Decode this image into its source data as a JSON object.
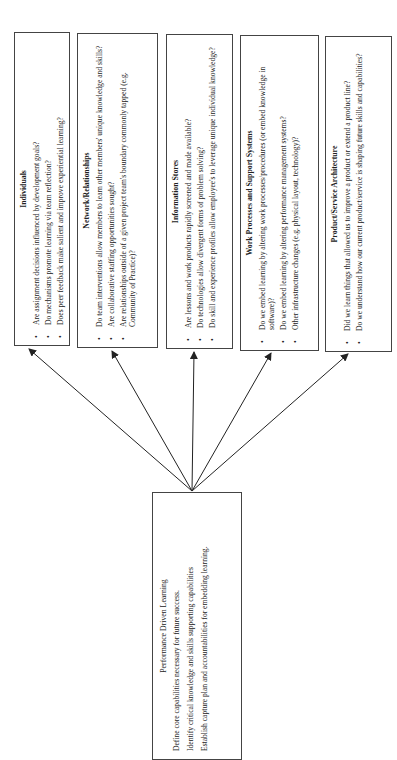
{
  "diagram": {
    "root": {
      "title": "Performance Driven Learning",
      "lines": [
        "Define core capabilities necessary for future success.",
        "Identify critical knowledge and skills supporting capabilities",
        "Establish capture plan and accountabilities for embedding learning."
      ]
    },
    "children": [
      {
        "title": "Individuals",
        "bullets": [
          "Are assignment decisions influenced by development goals?",
          "Do mechanisms promote learning via team reflection?",
          "Does peer feedback make salient and improve experiential learning?"
        ]
      },
      {
        "title": "Network/Relationships",
        "bullets": [
          "Do team interventions allow members to learn other members' unique knowledge and skills?",
          "Are collaborative staffing opportunities sought?",
          "Are relationships outside of a given project team's boundary commonly tapped (e.g. Community of Practice)?"
        ]
      },
      {
        "title": "Information Stores",
        "bullets": [
          "Are lessons and work products rapidly screened and made available?",
          "Do technologies allow divergent forms of problem solving?",
          "Do skill and experience profiles allow employee's to leverage unique individual knowledge?"
        ]
      },
      {
        "title": "Work Processes and Support Systems",
        "bullets": [
          "Do we embed learning by altering work processes/procedures (or embed knowledge in software)?",
          "Do we embed learning by altering performance management systems?",
          "Other infrastructure changes (e.g. physical layout, technology)?"
        ]
      },
      {
        "title": "Product/Service Architecture",
        "bullets": [
          "Did we learn things that allowed us to improve a product or extend a product line?",
          "Do we understand how our current product/service is shaping future skills and capabilities?"
        ]
      }
    ],
    "colors": {
      "line": "#222222",
      "border": "#444444",
      "background": "#ffffff"
    }
  }
}
